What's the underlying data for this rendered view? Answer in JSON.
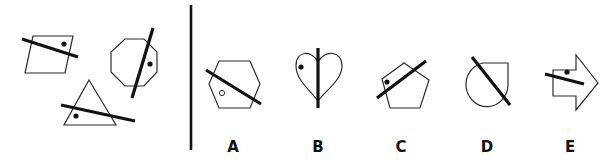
{
  "puzzle": {
    "type": "odd-one-out / which figure completes the set",
    "divider": {
      "x": 191,
      "y1": 5,
      "y2": 150
    },
    "examples": [
      {
        "shape": "parallelogram",
        "line": "crosses shape",
        "dot": "filled"
      },
      {
        "shape": "octagon",
        "line": "crosses shape",
        "dot": "filled"
      },
      {
        "shape": "triangle",
        "line": "crosses shape",
        "dot": "filled"
      }
    ],
    "options": [
      {
        "label": "A",
        "shape": "hexagon",
        "dot": "hollow"
      },
      {
        "label": "B",
        "shape": "heart",
        "dot": "filled"
      },
      {
        "label": "C",
        "shape": "pentagon",
        "dot": "filled"
      },
      {
        "label": "D",
        "shape": "teardrop",
        "dot": "none"
      },
      {
        "label": "E",
        "shape": "arrow",
        "dot": "filled"
      }
    ]
  },
  "colors": {
    "ink": "#111111",
    "outline": "#2b2b2b",
    "background": "#ffffff"
  }
}
